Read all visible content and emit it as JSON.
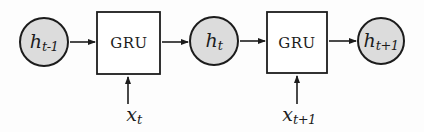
{
  "diagram": {
    "colors": {
      "node_fill": "#dcdcdc",
      "stroke": "#1c1c1c",
      "box_fill": "#ffffff",
      "background": "#fdfdfd"
    },
    "nodes": {
      "h_prev": {
        "main": "h",
        "sub": "t-1"
      },
      "gru1": {
        "label": "GRU"
      },
      "h_t": {
        "main": "h",
        "sub": "t"
      },
      "gru2": {
        "label": "GRU"
      },
      "h_next": {
        "main": "h",
        "sub": "t+1"
      },
      "x_t": {
        "main": "x",
        "sub": "t"
      },
      "x_next": {
        "main": "x",
        "sub": "t+1"
      }
    }
  }
}
